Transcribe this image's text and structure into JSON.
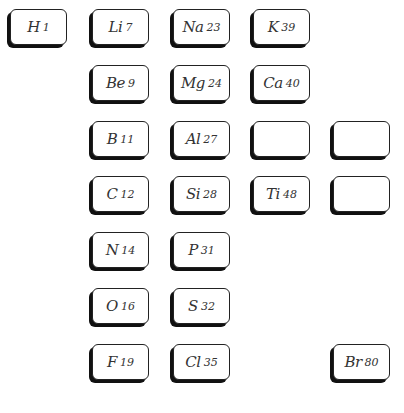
{
  "cards": [
    {
      "symbol": "H",
      "weight": "1",
      "col": 0,
      "row": 0
    },
    {
      "symbol": "Li",
      "weight": "7",
      "col": 1,
      "row": 0
    },
    {
      "symbol": "Na",
      "weight": "23",
      "col": 2,
      "row": 0
    },
    {
      "symbol": "K",
      "weight": "39",
      "col": 3,
      "row": 0
    },
    {
      "symbol": "Be",
      "weight": "9",
      "col": 1,
      "row": 1
    },
    {
      "symbol": "Mg",
      "weight": "24",
      "col": 2,
      "row": 1
    },
    {
      "symbol": "Ca",
      "weight": "40",
      "col": 3,
      "row": 1
    },
    {
      "symbol": "B",
      "weight": "11",
      "col": 1,
      "row": 2
    },
    {
      "symbol": "Al",
      "weight": "27",
      "col": 2,
      "row": 2
    },
    {
      "symbol": "",
      "weight": "",
      "col": 3,
      "row": 2
    },
    {
      "symbol": "",
      "weight": "",
      "col": 4,
      "row": 2
    },
    {
      "symbol": "C",
      "weight": "12",
      "col": 1,
      "row": 3
    },
    {
      "symbol": "Si",
      "weight": "28",
      "col": 2,
      "row": 3
    },
    {
      "symbol": "Ti",
      "weight": "48",
      "col": 3,
      "row": 3
    },
    {
      "symbol": "",
      "weight": "",
      "col": 4,
      "row": 3
    },
    {
      "symbol": "N",
      "weight": "14",
      "col": 1,
      "row": 4
    },
    {
      "symbol": "P",
      "weight": "31",
      "col": 2,
      "row": 4
    },
    {
      "symbol": "O",
      "weight": "16",
      "col": 1,
      "row": 5
    },
    {
      "symbol": "S",
      "weight": "32",
      "col": 2,
      "row": 5
    },
    {
      "symbol": "F",
      "weight": "19",
      "col": 1,
      "row": 6
    },
    {
      "symbol": "Cl",
      "weight": "35",
      "col": 2,
      "row": 6
    },
    {
      "symbol": "Br",
      "weight": "80",
      "col": 4,
      "row": 6
    }
  ]
}
